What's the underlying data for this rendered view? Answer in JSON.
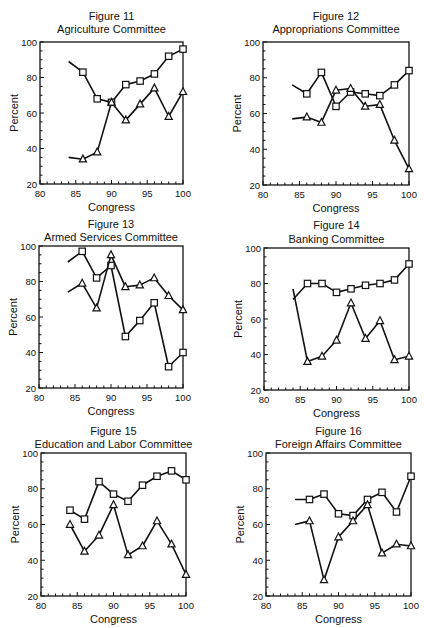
{
  "chart_data": [
    {
      "type": "line",
      "figure": "Figure 11",
      "title": "Agriculture Committee",
      "xlabel": "Congress",
      "ylabel": "Percent",
      "xlim": [
        80,
        100
      ],
      "ylim": [
        20,
        100
      ],
      "xticks": [
        80,
        85,
        90,
        95,
        100
      ],
      "yticks": [
        20,
        40,
        60,
        80,
        100
      ],
      "grid": false,
      "x": [
        84,
        86,
        88,
        90,
        92,
        94,
        96,
        98,
        100
      ],
      "series": [
        {
          "name": "squares",
          "marker": "square",
          "values": [
            89,
            83,
            68,
            66,
            76,
            78,
            82,
            92,
            96
          ]
        },
        {
          "name": "triangles",
          "marker": "triangle",
          "values": [
            35,
            34,
            38,
            66,
            56,
            65,
            74,
            58,
            72
          ]
        }
      ],
      "first_point_marked": false
    },
    {
      "type": "line",
      "figure": "Figure 12",
      "title": "Appropriations Committee",
      "xlabel": "Congress",
      "ylabel": "Percent",
      "xlim": [
        80,
        100
      ],
      "ylim": [
        20,
        100
      ],
      "xticks": [
        80,
        85,
        90,
        95,
        100
      ],
      "yticks": [
        20,
        40,
        60,
        80,
        100
      ],
      "grid": false,
      "x": [
        84,
        86,
        88,
        90,
        92,
        94,
        96,
        98,
        100
      ],
      "series": [
        {
          "name": "squares",
          "marker": "square",
          "values": [
            76,
            71,
            83,
            64,
            72,
            71,
            70,
            76,
            84
          ]
        },
        {
          "name": "triangles",
          "marker": "triangle",
          "values": [
            57,
            58,
            55,
            73,
            74,
            64,
            65,
            45,
            29
          ]
        }
      ],
      "first_point_marked": false
    },
    {
      "type": "line",
      "figure": "Figure 13",
      "title": "Armed Services Committee",
      "xlabel": "Congress",
      "ylabel": "Percent",
      "xlim": [
        80,
        100
      ],
      "ylim": [
        20,
        100
      ],
      "xticks": [
        80,
        85,
        90,
        95,
        100
      ],
      "yticks": [
        20,
        40,
        60,
        80,
        100
      ],
      "grid": false,
      "x": [
        84,
        86,
        88,
        90,
        92,
        94,
        96,
        98,
        100
      ],
      "series": [
        {
          "name": "squares",
          "marker": "square",
          "values": [
            91,
            97,
            82,
            89,
            49,
            58,
            68,
            32,
            40
          ]
        },
        {
          "name": "triangles",
          "marker": "triangle",
          "values": [
            74,
            79,
            65,
            95,
            77,
            78,
            82,
            72,
            64
          ]
        }
      ],
      "first_point_marked": false
    },
    {
      "type": "line",
      "figure": "Figure 14",
      "title": "Banking Committee",
      "xlabel": "Congress",
      "ylabel": "Percent",
      "xlim": [
        80,
        100
      ],
      "ylim": [
        20,
        100
      ],
      "xticks": [
        80,
        85,
        90,
        95,
        100
      ],
      "yticks": [
        20,
        40,
        60,
        80,
        100
      ],
      "grid": false,
      "x": [
        84,
        86,
        88,
        90,
        92,
        94,
        96,
        98,
        100
      ],
      "series": [
        {
          "name": "squares",
          "marker": "square",
          "values": [
            71,
            80,
            80,
            75,
            77,
            79,
            80,
            82,
            91
          ]
        },
        {
          "name": "triangles",
          "marker": "triangle",
          "values": [
            77,
            36,
            39,
            48,
            69,
            49,
            59,
            37,
            39
          ]
        }
      ],
      "first_point_marked": false
    },
    {
      "type": "line",
      "figure": "Figure 15",
      "title": "Education and Labor Committee",
      "xlabel": "Congress",
      "ylabel": "Percent",
      "xlim": [
        80,
        100
      ],
      "ylim": [
        20,
        100
      ],
      "xticks": [
        80,
        85,
        90,
        95,
        100
      ],
      "yticks": [
        20,
        40,
        60,
        80,
        100
      ],
      "grid": false,
      "x": [
        84,
        86,
        88,
        90,
        92,
        94,
        96,
        98,
        100
      ],
      "series": [
        {
          "name": "squares",
          "marker": "square",
          "values": [
            68,
            63,
            84,
            77,
            73,
            82,
            87,
            90,
            85
          ]
        },
        {
          "name": "triangles",
          "marker": "triangle",
          "values": [
            60,
            45,
            54,
            71,
            43,
            48,
            62,
            49,
            32
          ]
        }
      ],
      "first_point_marked": true
    },
    {
      "type": "line",
      "figure": "Figure 16",
      "title": "Foreign Affairs Committee",
      "xlabel": "Congress",
      "ylabel": "Percent",
      "xlim": [
        80,
        100
      ],
      "ylim": [
        20,
        100
      ],
      "xticks": [
        80,
        85,
        90,
        95,
        100
      ],
      "yticks": [
        20,
        40,
        60,
        80,
        100
      ],
      "grid": false,
      "x": [
        84,
        86,
        88,
        90,
        92,
        94,
        96,
        98,
        100
      ],
      "series": [
        {
          "name": "squares",
          "marker": "square",
          "values": [
            74,
            74,
            77,
            66,
            65,
            74,
            78,
            67,
            87
          ]
        },
        {
          "name": "triangles",
          "marker": "triangle",
          "values": [
            60,
            62,
            29,
            53,
            62,
            71,
            44,
            49,
            48
          ]
        }
      ],
      "first_point_marked": false
    }
  ],
  "layout": {
    "panels": [
      {
        "left": 40,
        "top": 42,
        "right": 183,
        "bottom": 184,
        "title_y": 16,
        "subtitle_y": 29
      },
      {
        "left": 263,
        "top": 42,
        "right": 409,
        "bottom": 185,
        "title_y": 16,
        "subtitle_y": 29
      },
      {
        "left": 39,
        "top": 246,
        "right": 183,
        "bottom": 388,
        "title_y": 224,
        "subtitle_y": 237
      },
      {
        "left": 264,
        "top": 248,
        "right": 409,
        "bottom": 390,
        "title_y": 225,
        "subtitle_y": 239
      },
      {
        "left": 41,
        "top": 453,
        "right": 186,
        "bottom": 596,
        "title_y": 431,
        "subtitle_y": 444
      },
      {
        "left": 266,
        "top": 453,
        "right": 411,
        "bottom": 596,
        "title_y": 431,
        "subtitle_y": 444
      }
    ]
  }
}
